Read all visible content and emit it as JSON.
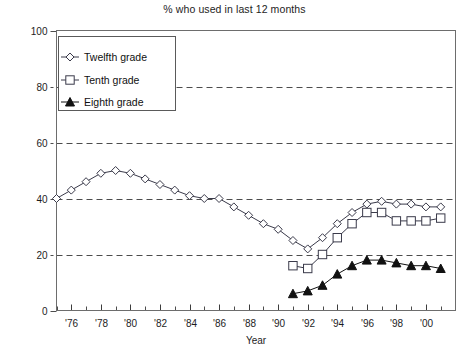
{
  "chart_data": {
    "type": "line",
    "title": "% who used in last 12 months",
    "xlabel": "Year",
    "ylabel": "",
    "xlim": [
      1975,
      2002
    ],
    "ylim": [
      0,
      100
    ],
    "grid": true,
    "grid_style": "dashed-horizontal",
    "legend_position": "top-left-inside",
    "y_ticks": [
      0,
      20,
      40,
      60,
      80,
      100
    ],
    "y_tick_labels": [
      "0",
      "20",
      "40",
      "60",
      "80",
      "100"
    ],
    "x_ticks": [
      1976,
      1978,
      1980,
      1982,
      1984,
      1986,
      1988,
      1990,
      1992,
      1994,
      1996,
      1998,
      2000
    ],
    "x_tick_labels": [
      "'76",
      "'78",
      "'80",
      "'82",
      "'84",
      "'86",
      "'88",
      "'90",
      "'92",
      "'94",
      "'96",
      "'98",
      "'00"
    ],
    "x_minor_ticks": [
      1975,
      1977,
      1979,
      1981,
      1983,
      1985,
      1987,
      1989,
      1991,
      1993,
      1995,
      1997,
      1999,
      2001
    ],
    "series": [
      {
        "name": "Twelfth grade",
        "marker": "open-diamond",
        "color": "#3a3a4a",
        "x": [
          1975,
          1976,
          1977,
          1978,
          1979,
          1980,
          1981,
          1982,
          1983,
          1984,
          1985,
          1986,
          1987,
          1988,
          1989,
          1990,
          1991,
          1992,
          1993,
          1994,
          1995,
          1996,
          1997,
          1998,
          1999,
          2000,
          2001
        ],
        "values": [
          40,
          43,
          46,
          49,
          50,
          49,
          47,
          45,
          43,
          41,
          40,
          40,
          37,
          34,
          31,
          29,
          25,
          22,
          26,
          31,
          35,
          38,
          39,
          38,
          38,
          37,
          37
        ]
      },
      {
        "name": "Tenth grade",
        "marker": "open-square",
        "color": "#3a3a4a",
        "x": [
          1991,
          1992,
          1993,
          1994,
          1995,
          1996,
          1997,
          1998,
          1999,
          2000,
          2001
        ],
        "values": [
          16,
          15,
          20,
          26,
          31,
          35,
          35,
          32,
          32,
          32,
          33
        ]
      },
      {
        "name": "Eighth grade",
        "marker": "filled-triangle",
        "color": "#111111",
        "x": [
          1991,
          1992,
          1993,
          1994,
          1995,
          1996,
          1997,
          1998,
          1999,
          2000,
          2001
        ],
        "values": [
          6,
          7,
          9,
          13,
          16,
          18,
          18,
          17,
          16,
          16,
          15
        ]
      }
    ]
  },
  "legend": {
    "entries": [
      {
        "label": "Twelfth grade"
      },
      {
        "label": "Tenth grade"
      },
      {
        "label": "Eighth grade"
      }
    ]
  }
}
